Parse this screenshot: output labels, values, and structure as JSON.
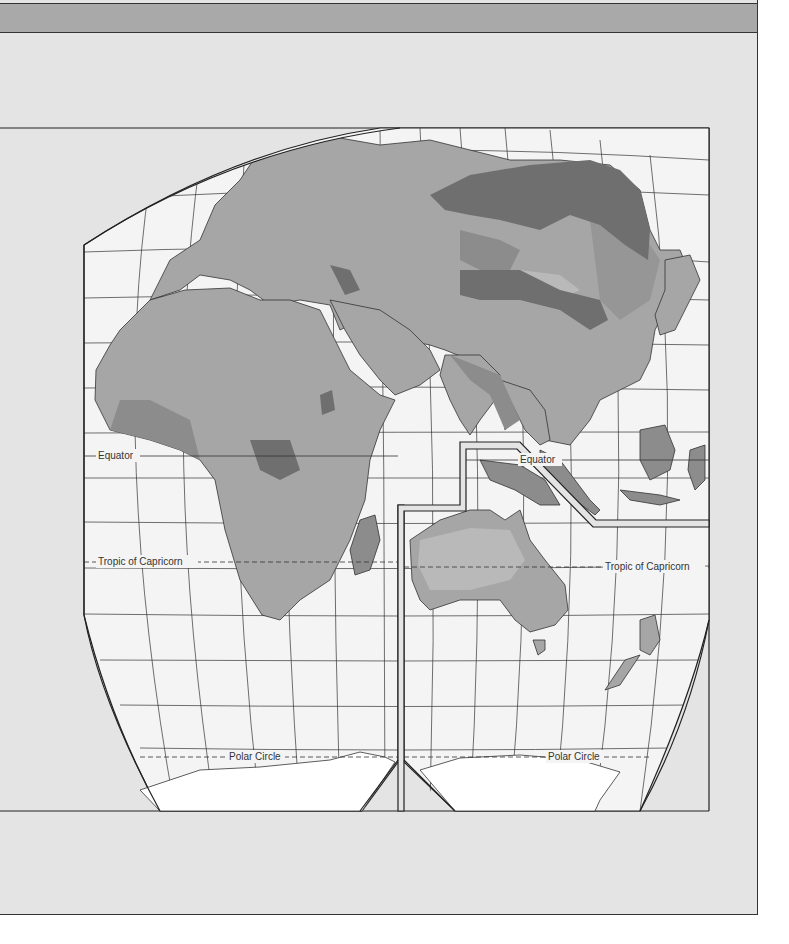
{
  "map": {
    "title": "",
    "projection": "interrupted-eastern-hemisphere",
    "labels": {
      "equator_left": "Equator",
      "equator_right": "Equator",
      "tropic_left": "Tropic of Capricorn",
      "tropic_right": "Tropic of Capricorn",
      "polar_left": "Polar Circle",
      "polar_right": "Polar Circle"
    },
    "regions": [
      "Europe",
      "Africa",
      "Asia",
      "Australia",
      "Antarctica",
      "Madagascar",
      "New Zealand",
      "Indonesia",
      "Japan"
    ],
    "colors": {
      "panel": "#e4e4e4",
      "header": "#a9a9a9",
      "ocean": "#f4f4f4",
      "shade_dark": "#6f6f6f",
      "shade_medium": "#8c8c8c",
      "shade_light": "#a6a6a6",
      "shade_lightest": "#b9b9b9",
      "antarctica": "#ffffff",
      "line": "#222222"
    }
  }
}
